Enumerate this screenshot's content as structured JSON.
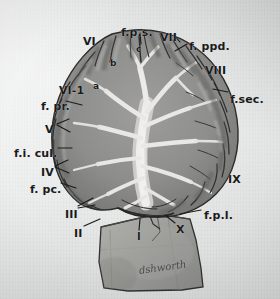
{
  "figure": {
    "medium": "grayscale anatomical photograph on gray paper",
    "background_color": "#e6e7e7",
    "ink_color": "#1a1a1a",
    "cortex_color": "#8a8a8a",
    "white_matter_color": "#e4e4e2",
    "brainstem_color": "#9b9b99"
  },
  "labels": [
    {
      "id": "lobule-VI",
      "text": "VI",
      "x": 83,
      "y": 36,
      "size": 11
    },
    {
      "id": "fissura-prima-superior",
      "text": "f.p.s.",
      "x": 121,
      "y": 27,
      "size": 11
    },
    {
      "id": "lobule-VII",
      "text": "VII",
      "x": 160,
      "y": 32,
      "size": 11
    },
    {
      "id": "fissura-prepyramidalis-dorsalis",
      "text": "f. ppd.",
      "x": 189,
      "y": 41,
      "size": 11
    },
    {
      "id": "lobule-VIII",
      "text": "VIII",
      "x": 205,
      "y": 65,
      "size": 11
    },
    {
      "id": "fissura-secunda",
      "text": "f.sec.",
      "x": 230,
      "y": 94,
      "size": 11
    },
    {
      "id": "lobule-VI-1",
      "text": "VI-1",
      "x": 59,
      "y": 85,
      "size": 11
    },
    {
      "id": "fissura-prima",
      "text": "f. pr.",
      "x": 41,
      "y": 101,
      "size": 11
    },
    {
      "id": "lobule-V",
      "text": "V",
      "x": 45,
      "y": 124,
      "size": 11
    },
    {
      "id": "fissura-intraculminaris",
      "text": "f.i. cul.",
      "x": 14,
      "y": 148,
      "size": 11
    },
    {
      "id": "lobule-IV",
      "text": "IV",
      "x": 41,
      "y": 167,
      "size": 11
    },
    {
      "id": "fissura-postcentralis",
      "text": "f. pc.",
      "x": 30,
      "y": 184,
      "size": 11
    },
    {
      "id": "lobule-III",
      "text": "III",
      "x": 65,
      "y": 209,
      "size": 11
    },
    {
      "id": "lobule-II",
      "text": "II",
      "x": 74,
      "y": 228,
      "size": 11
    },
    {
      "id": "lobule-I",
      "text": "I",
      "x": 137,
      "y": 232,
      "size": 10
    },
    {
      "id": "lobule-X",
      "text": "X",
      "x": 176,
      "y": 224,
      "size": 11
    },
    {
      "id": "lobule-IX",
      "text": "IX",
      "x": 228,
      "y": 174,
      "size": 11
    },
    {
      "id": "fissura-posterolateralis",
      "text": "f.p.l.",
      "x": 204,
      "y": 210,
      "size": 11
    },
    {
      "id": "folium-a",
      "text": "a",
      "x": 93,
      "y": 82,
      "size": 9
    },
    {
      "id": "folium-b",
      "text": "b",
      "x": 110,
      "y": 59,
      "size": 9
    },
    {
      "id": "folium-c",
      "text": "c",
      "x": 136,
      "y": 45,
      "size": 9
    }
  ],
  "signature": {
    "text": "dshworth",
    "x": 139,
    "y": 266,
    "rotation": -8
  }
}
